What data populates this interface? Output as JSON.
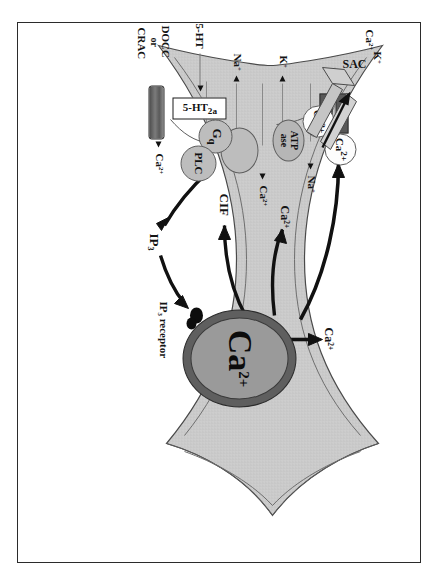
{
  "figure": {
    "orientation": "rotated-90-clockwise",
    "colors": {
      "frame_border": "#2b2b2b",
      "cytoplasm_fill": "#c9c9c9",
      "membrane_line": "#4a4a4a",
      "er_outer": "#5f5f5f",
      "er_inner": "#9a9a9a",
      "channel_dark": "#585858",
      "arrow_black": "#111111",
      "background": "#ffffff"
    }
  },
  "labels": {
    "sac": "SAC",
    "k_efflux": "K",
    "k_efflux_sup": "+",
    "ca_efflux": "Ca",
    "ca_efflux_sup": "2+",
    "na_top": "Na",
    "na_top_sup": "+",
    "k_left": "K",
    "k_left_sup": "+",
    "ca_pump": "Ca",
    "ca_pump_sup": "2+",
    "na_exch": "Na",
    "na_exch_sup": "+",
    "atpase_line1": "ATP",
    "atpase_line2": "ase",
    "five_ht": "5-HT",
    "receptor_main": "5-HT",
    "receptor_sub": "2a",
    "gq": "G",
    "gq_sub": "q",
    "plc": "PLC",
    "docc_line1": "DOCC",
    "docc_line2": "or",
    "docc_line3": "CRAC",
    "ca_docc": "Ca",
    "ca_docc_sup": "2+",
    "ca_vesicle_1": "Ca",
    "ca_vesicle_1_sup": "2+",
    "ca_vesicle_2": "Ca",
    "ca_vesicle_2_sup": "2+",
    "ca_cyto_mid": "Ca",
    "ca_cyto_mid_sup": "2+",
    "ca_cyto_right": "Ca",
    "ca_cyto_right_sup": "2+",
    "cif": "CIF",
    "ip3": "IP",
    "ip3_sub": "3",
    "ip3_receptor": "IP",
    "ip3_receptor_sub": "3",
    "ip3_receptor_tail": " receptor",
    "er_store": "Ca",
    "er_store_sup": "2+"
  },
  "elements": [
    {
      "name": "sac-channel",
      "type": "stretch-activated-channel",
      "label": "SAC"
    },
    {
      "name": "na-k-atpase",
      "type": "pump",
      "label": "ATP ase"
    },
    {
      "name": "na-ca-exchanger",
      "type": "exchanger",
      "label": ""
    },
    {
      "name": "ht2a-receptor",
      "type": "gpcr",
      "label": "5-HT2a"
    },
    {
      "name": "gq-protein",
      "type": "g-protein",
      "label": "Gq"
    },
    {
      "name": "plc-enzyme",
      "type": "enzyme",
      "label": "PLC"
    },
    {
      "name": "docc-crac-channel",
      "type": "store-operated-channel",
      "label": "DOCC or CRAC"
    },
    {
      "name": "er-calcium-store",
      "type": "organelle",
      "label": "Ca2+"
    },
    {
      "name": "ip3-receptor",
      "type": "receptor",
      "label": "IP3 receptor"
    },
    {
      "name": "calcium-vesicle-1",
      "type": "vesicle",
      "label": "Ca2+"
    },
    {
      "name": "calcium-vesicle-2",
      "type": "vesicle",
      "label": "Ca2+"
    }
  ],
  "arrows": [
    {
      "name": "arrow-er-to-membrane",
      "from": "er-calcium-store",
      "to": "calcium-vesicle-region"
    },
    {
      "name": "arrow-er-to-cytosol",
      "from": "er-calcium-store",
      "to": "ca-cyto-mid"
    },
    {
      "name": "arrow-er-to-cif",
      "from": "er-calcium-store",
      "to": "cif"
    },
    {
      "name": "arrow-er-up",
      "from": "er-calcium-store",
      "to": "ca-cyto-right"
    },
    {
      "name": "arrow-plc-to-ip3",
      "from": "plc-enzyme",
      "to": "ip3"
    },
    {
      "name": "arrow-ip3-to-receptor",
      "from": "ip3",
      "to": "ip3-receptor"
    }
  ]
}
